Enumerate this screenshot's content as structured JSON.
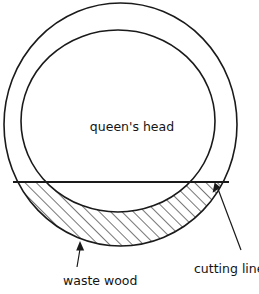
{
  "figure": {
    "background_color": "#ffffff",
    "stroke_color": "#1a1a1a",
    "text_color": "#141414",
    "width": 259,
    "height": 294
  },
  "labels": {
    "center": "queen's head",
    "waste": "waste wood",
    "cutting": "cutting line"
  },
  "geometry": {
    "outer_circle": {
      "cx": 120.5,
      "cy": 124.5,
      "rx": 116.5,
      "ry": 121.5
    },
    "inner_circle": {
      "cx": 118.0,
      "cy": 121.0,
      "rx": 97.0,
      "ry": 91.0
    },
    "cutting_line": {
      "y": 182.0,
      "x1": 13.0,
      "x2": 229.0
    },
    "hatch_angle_deg": 45,
    "hatch_spacing": 8
  },
  "annotations": {
    "waste_arrow": {
      "from_x": 78,
      "from_y": 266,
      "to_x": 80,
      "to_y": 243
    },
    "cutting_arrow": {
      "from_x": 240,
      "from_y": 247,
      "to_x": 216,
      "to_y": 184
    }
  },
  "text_positions": {
    "center_label": {
      "x": 132,
      "y": 131
    },
    "waste_label": {
      "x": 63,
      "y": 284
    },
    "cutting_label": {
      "x": 193,
      "y": 272
    }
  }
}
